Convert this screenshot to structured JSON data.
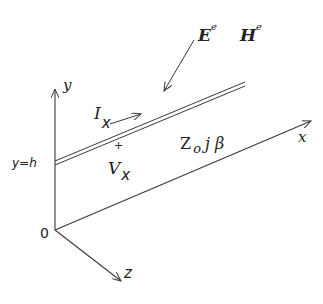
{
  "diagram": {
    "type": "transmission line coordinate diagram",
    "labels": {
      "field_E": "E",
      "field_E_sup": "e",
      "field_H": "H",
      "field_H_sup": "e",
      "axis_y": "y",
      "axis_x": "x",
      "axis_z": "z",
      "origin": "0",
      "height_marker": "y=h",
      "current": "I",
      "current_sub": "x",
      "voltage": "V",
      "voltage_sub": "x",
      "voltage_polarity": "+",
      "impedance": "Z",
      "impedance_sub": "o",
      "propagation": "j β"
    },
    "colors": {
      "line": "#3a3a3a",
      "text": "#222222"
    }
  }
}
